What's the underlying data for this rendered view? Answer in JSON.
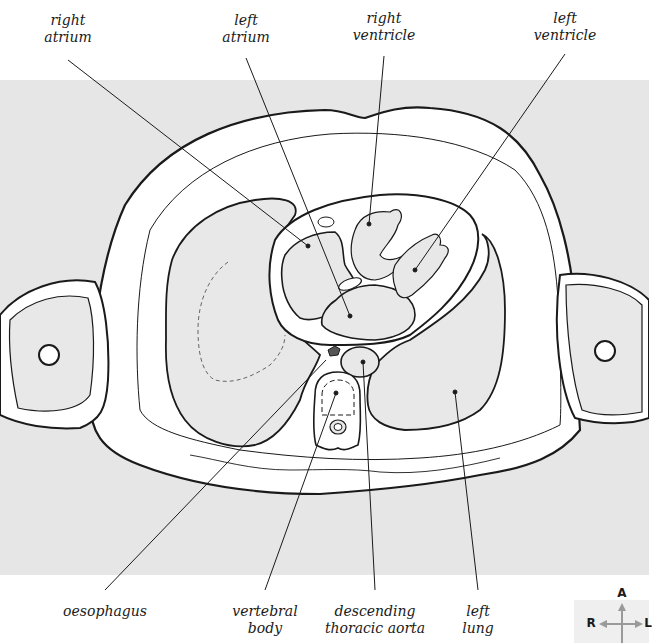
{
  "diagram": {
    "colors": {
      "background_band": "#e6e6e6",
      "tissue_fill": "#e8e8e8",
      "outline": "#1a1a1a",
      "compass_arrow": "#9a9a9a"
    },
    "labels": {
      "top": [
        {
          "id": "right-atrium",
          "line1": "right",
          "line2": "atrium",
          "x": 68,
          "y": 12
        },
        {
          "id": "left-atrium",
          "line1": "left",
          "line2": "atrium",
          "x": 246,
          "y": 12
        },
        {
          "id": "right-ventricle",
          "line1": "right",
          "line2": "ventricle",
          "x": 384,
          "y": 10
        },
        {
          "id": "left-ventricle",
          "line1": "left",
          "line2": "ventricle",
          "x": 565,
          "y": 10
        }
      ],
      "bottom": [
        {
          "id": "oesophagus",
          "line1": "oesophagus",
          "line2": "",
          "x": 105,
          "y": 603
        },
        {
          "id": "vertebral-body",
          "line1": "vertebral",
          "line2": "body",
          "x": 265,
          "y": 603
        },
        {
          "id": "descending-thoracic-aorta",
          "line1": "descending",
          "line2": "thoracic aorta",
          "x": 380,
          "y": 603
        },
        {
          "id": "left-lung",
          "line1": "left",
          "line2": "lung",
          "x": 480,
          "y": 603
        }
      ]
    },
    "compass": {
      "anterior": "A",
      "right": "R",
      "left": "L"
    }
  }
}
